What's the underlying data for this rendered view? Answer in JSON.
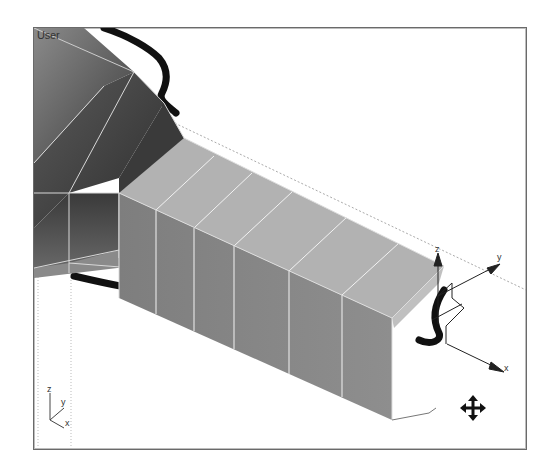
{
  "viewport": {
    "label": "User",
    "type": "3d-viewport"
  },
  "gizmo": {
    "axes": {
      "x": "x",
      "y": "y",
      "z": "z"
    }
  },
  "world_axis": {
    "axes": {
      "x": "x",
      "y": "y",
      "z": "z"
    }
  },
  "cursor": {
    "icon": "move-cursor-icon"
  },
  "colors": {
    "frame": "#6a6a6a",
    "top_face": "#b4b4b4",
    "side_face": "#8a8a8a",
    "cone_dark": "#4a4a4a",
    "outline": "#111111"
  }
}
